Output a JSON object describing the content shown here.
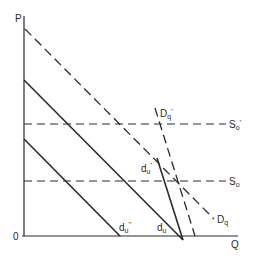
{
  "diagram": {
    "axes": {
      "y_label": "P",
      "x_label": "Q",
      "origin_label": "0"
    },
    "curves": [
      {
        "id": "Dq",
        "label": "D",
        "sub": "q",
        "prime": "",
        "style": "dashed"
      },
      {
        "id": "Dq_prime",
        "label": "D",
        "sub": "q",
        "prime": "'",
        "style": "dashed"
      },
      {
        "id": "du",
        "label": "d",
        "sub": "u",
        "prime": "",
        "style": "solid"
      },
      {
        "id": "du_prime",
        "label": "d",
        "sub": "u",
        "prime": "'",
        "style": "solid"
      },
      {
        "id": "du_dprime",
        "label": "d",
        "sub": "u",
        "prime": "''",
        "style": "solid"
      },
      {
        "id": "So",
        "label": "S",
        "sub": "o",
        "prime": "",
        "style": "dashed"
      },
      {
        "id": "So_prime",
        "label": "S",
        "sub": "o",
        "prime": "'",
        "style": "dashed"
      }
    ],
    "colors": {
      "line": "#2a2a2a",
      "background": "#ffffff"
    }
  }
}
